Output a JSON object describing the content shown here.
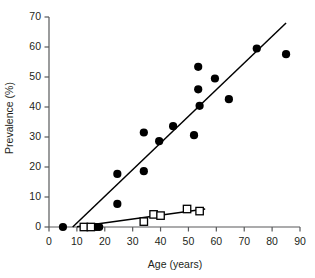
{
  "chart_data": {
    "type": "scatter",
    "title": "",
    "xlabel": "Age (years)",
    "ylabel": "Prevalence (%)",
    "xlim": [
      0,
      90
    ],
    "ylim": [
      0,
      70
    ],
    "xticks": [
      0,
      10,
      20,
      30,
      40,
      50,
      60,
      70,
      80,
      90
    ],
    "yticks": [
      0,
      10,
      20,
      30,
      40,
      50,
      60,
      70
    ],
    "grid": false,
    "legend": "none",
    "series": [
      {
        "name": "filled-circles",
        "marker": "filled-circle",
        "color": "#000000",
        "points": [
          {
            "x": 5,
            "y": 0
          },
          {
            "x": 16,
            "y": 0
          },
          {
            "x": 17,
            "y": 0
          },
          {
            "x": 18,
            "y": 0
          },
          {
            "x": 24.5,
            "y": 17.7
          },
          {
            "x": 24.5,
            "y": 7.7
          },
          {
            "x": 34,
            "y": 31.5
          },
          {
            "x": 34,
            "y": 18.6
          },
          {
            "x": 39.5,
            "y": 28.6
          },
          {
            "x": 44.5,
            "y": 33.6
          },
          {
            "x": 52,
            "y": 30.6
          },
          {
            "x": 53.5,
            "y": 53.4
          },
          {
            "x": 53.5,
            "y": 45.9
          },
          {
            "x": 54,
            "y": 40.4
          },
          {
            "x": 59.5,
            "y": 49.5
          },
          {
            "x": 64.5,
            "y": 42.6
          },
          {
            "x": 74.5,
            "y": 59.5
          },
          {
            "x": 85,
            "y": 57.6
          }
        ],
        "fit_line": {
          "x1": 8.5,
          "y1": 0,
          "x2": 85,
          "y2": 68
        }
      },
      {
        "name": "open-squares",
        "marker": "open-square",
        "color": "#000000",
        "points": [
          {
            "x": 12.5,
            "y": 0
          },
          {
            "x": 15,
            "y": 0
          },
          {
            "x": 34,
            "y": 1.8
          },
          {
            "x": 37.5,
            "y": 4.2
          },
          {
            "x": 40,
            "y": 3.8
          },
          {
            "x": 49.5,
            "y": 6.0
          },
          {
            "x": 54,
            "y": 5.3
          }
        ],
        "fit_line": {
          "x1": 10,
          "y1": 0.1,
          "x2": 56,
          "y2": 6.0
        }
      }
    ]
  },
  "axes": {
    "x_tick_labels": [
      "0",
      "10",
      "20",
      "30",
      "40",
      "50",
      "60",
      "70",
      "80",
      "90"
    ],
    "y_tick_labels": [
      "0",
      "10",
      "20",
      "30",
      "40",
      "50",
      "60",
      "70"
    ],
    "x_axis_title": "Age (years)",
    "y_axis_title": "Prevalence (%)"
  },
  "style": {
    "axis_color": "#58595b",
    "marker_color": "#000000",
    "line_color": "#000000",
    "background": "#ffffff"
  }
}
